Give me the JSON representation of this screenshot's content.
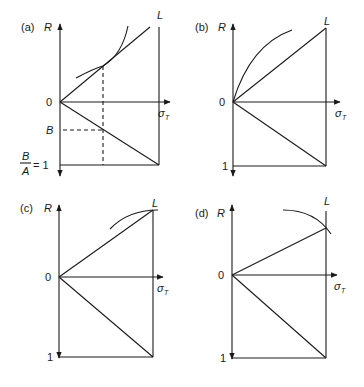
{
  "panels": {
    "a": {
      "tag": "(a)",
      "y_axis": "R",
      "x_axis": "σ",
      "x_axis_sub": "T",
      "origin": "0",
      "top_right": "L",
      "mid_left": "B",
      "bottom_left_num": "B",
      "bottom_left_den": "A",
      "bottom_left_eq": "= 1"
    },
    "b": {
      "tag": "(b)",
      "y_axis": "R",
      "x_axis": "σ",
      "x_axis_sub": "T",
      "origin": "0",
      "top_right": "L",
      "bottom_left": "1"
    },
    "c": {
      "tag": "(c)",
      "y_axis": "R",
      "x_axis": "σ",
      "x_axis_sub": "T",
      "origin": "0",
      "top_right": "L",
      "bottom_left": "1"
    },
    "d": {
      "tag": "(d)",
      "y_axis": "R",
      "x_axis": "σ",
      "x_axis_sub": "T",
      "origin": "0",
      "top_right": "L",
      "bottom_left": "1"
    }
  }
}
